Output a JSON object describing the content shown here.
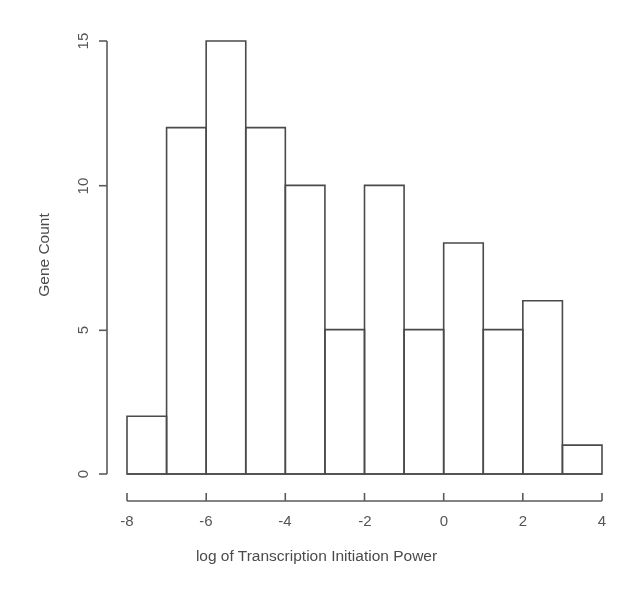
{
  "chart_data": {
    "type": "bar",
    "title": "",
    "subtitle": "",
    "xlabel": "log of Transcription Initiation Power",
    "ylabel": "Gene Count",
    "xlim": [
      -8,
      4
    ],
    "ylim": [
      0,
      15
    ],
    "grid": false,
    "legend": "none",
    "bin_width": 1,
    "bin_edges": [
      -8,
      -7,
      -6,
      -5,
      -4,
      -3,
      -2,
      -1,
      0,
      1,
      2,
      3,
      4
    ],
    "categories": [
      "-8 to -7",
      "-7 to -6",
      "-6 to -5",
      "-5 to -4",
      "-4 to -3",
      "-3 to -2",
      "-2 to -1",
      "-1 to 0",
      "0 to 1",
      "1 to 2",
      "2 to 3",
      "3 to 4"
    ],
    "values": [
      2,
      12,
      15,
      12,
      10,
      5,
      10,
      5,
      8,
      5,
      6,
      1
    ],
    "xticks": [
      -8,
      -6,
      -4,
      -2,
      0,
      2,
      4
    ],
    "xtick_labels": [
      "-8",
      "-6",
      "-4",
      "-2",
      "0",
      "2",
      "4"
    ],
    "yticks": [
      0,
      5,
      10,
      15
    ],
    "ytick_labels": [
      "0",
      "5",
      "10",
      "15"
    ],
    "total_count": 92,
    "bar_fill": "#ffffff",
    "bar_stroke": "#4a4a4a",
    "background": "#ffffff",
    "text_color": "#555555"
  }
}
